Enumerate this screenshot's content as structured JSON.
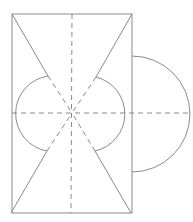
{
  "diagram": {
    "type": "geometric-net",
    "stroke_color": "#8a8a8a",
    "background": "#ffffff",
    "rectangle": {
      "x1": 12,
      "y1": 14,
      "x2": 132,
      "y2": 213
    },
    "center": {
      "x": 72,
      "y": 113
    },
    "outer_semicircle": {
      "cx": 132,
      "cy": 114,
      "r": 57,
      "side": "right"
    },
    "inner_arcs": [
      {
        "side": "left",
        "start": [
          48,
          76
        ],
        "end": [
          47,
          151
        ],
        "r": 38
      },
      {
        "side": "right",
        "start": [
          96,
          77
        ],
        "end": [
          95,
          151
        ],
        "r": 38
      }
    ],
    "dashed_lines": [
      "vertical-center",
      "horizontal-center",
      "diagonal-tl-br",
      "diagonal-tr-bl"
    ],
    "labels": []
  }
}
